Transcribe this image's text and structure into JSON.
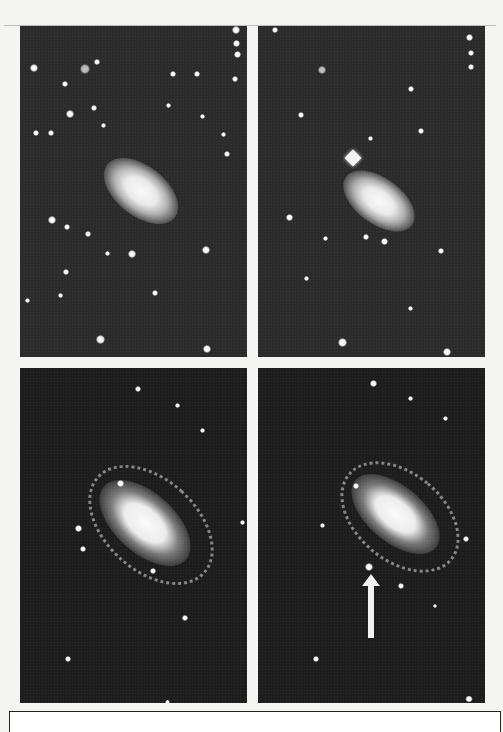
{
  "figure": {
    "background_color": "#f4f4f2",
    "panels": [
      {
        "id": "top-left",
        "x": 20,
        "y": 26,
        "w": 227,
        "h": 331,
        "bg": "#2b2b2b"
      },
      {
        "id": "top-right",
        "x": 258,
        "y": 26,
        "w": 227,
        "h": 331,
        "bg": "#2b2b2b",
        "feature": "diamond-shaped bright star above galaxy"
      },
      {
        "id": "bottom-left",
        "x": 20,
        "y": 368,
        "w": 227,
        "h": 335,
        "bg": "#1d1d1d"
      },
      {
        "id": "bottom-right",
        "x": 258,
        "y": 368,
        "w": 227,
        "h": 335,
        "bg": "#1d1d1d",
        "feature": "white arrow pointing up at supernova"
      }
    ],
    "arrow": {
      "color": "#f2f2f2",
      "tip_x": 371,
      "tip_y": 575,
      "tail_y": 636
    }
  }
}
